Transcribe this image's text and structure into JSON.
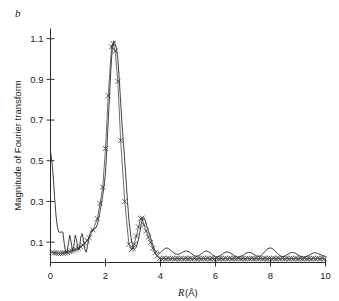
{
  "figure": {
    "panel_label": "b"
  },
  "chart_data": {
    "type": "line",
    "title": "",
    "subtitle": "",
    "panel": "b",
    "xlabel": "R (Å)",
    "xlabel_italic_part": "R",
    "xlabel_unit_part": " (Å)",
    "ylabel": "Magnitude of Fourier transform",
    "xlim": [
      0,
      10
    ],
    "ylim": [
      0,
      1.15
    ],
    "xticks": [
      0,
      2,
      4,
      6,
      8,
      10
    ],
    "xticklabels": [
      "0",
      "2",
      "4",
      "6",
      "8",
      "10"
    ],
    "yticks": [
      0.1,
      0.3,
      0.5,
      0.7,
      0.9,
      1.1
    ],
    "yticklabels": [
      "0.1",
      "0.3",
      "0.5",
      "0.7",
      "0.9",
      "1.1"
    ],
    "grid": false,
    "legend": null,
    "legend_position": "none",
    "series": [
      {
        "name": "experimental data",
        "style": "solid-line",
        "marker": "none",
        "color": "#2b2b2b",
        "x": [
          0.0,
          0.05,
          0.1,
          0.15,
          0.2,
          0.25,
          0.3,
          0.35,
          0.4,
          0.45,
          0.5,
          0.55,
          0.6,
          0.65,
          0.7,
          0.75,
          0.8,
          0.85,
          0.9,
          0.95,
          1.0,
          1.05,
          1.1,
          1.15,
          1.2,
          1.25,
          1.3,
          1.35,
          1.4,
          1.45,
          1.5,
          1.55,
          1.6,
          1.65,
          1.7,
          1.75,
          1.8,
          1.85,
          1.9,
          1.95,
          2.0,
          2.05,
          2.1,
          2.15,
          2.2,
          2.25,
          2.3,
          2.35,
          2.4,
          2.45,
          2.5,
          2.55,
          2.6,
          2.65,
          2.7,
          2.75,
          2.8,
          2.85,
          2.9,
          2.95,
          3.0,
          3.05,
          3.1,
          3.15,
          3.2,
          3.25,
          3.3,
          3.35,
          3.4,
          3.45,
          3.5,
          3.55,
          3.6,
          3.65,
          3.7,
          3.75,
          3.8,
          3.9,
          4.0,
          4.1,
          4.2,
          4.3,
          4.4,
          4.5,
          4.6,
          4.7,
          4.8,
          4.9,
          5.0,
          5.1,
          5.2,
          5.3,
          5.4,
          5.5,
          5.6,
          5.7,
          5.8,
          5.9,
          6.0,
          6.1,
          6.2,
          6.3,
          6.4,
          6.5,
          6.6,
          6.7,
          6.8,
          6.9,
          7.0,
          7.1,
          7.2,
          7.3,
          7.4,
          7.5,
          7.6,
          7.7,
          7.8,
          7.9,
          8.0,
          8.1,
          8.2,
          8.3,
          8.4,
          8.5,
          8.6,
          8.7,
          8.8,
          8.9,
          9.0,
          9.1,
          9.2,
          9.3,
          9.4,
          9.5,
          9.6,
          9.7,
          9.8,
          9.9,
          10.0
        ],
        "y": [
          0.545,
          0.5,
          0.42,
          0.32,
          0.23,
          0.175,
          0.15,
          0.148,
          0.15,
          0.15,
          0.092,
          0.05,
          0.052,
          0.092,
          0.135,
          0.1,
          0.06,
          0.08,
          0.135,
          0.11,
          0.062,
          0.065,
          0.125,
          0.142,
          0.108,
          0.065,
          0.05,
          0.085,
          0.125,
          0.148,
          0.16,
          0.16,
          0.165,
          0.17,
          0.185,
          0.215,
          0.25,
          0.29,
          0.33,
          0.38,
          0.44,
          0.56,
          0.7,
          0.83,
          0.96,
          1.06,
          1.09,
          1.075,
          1.05,
          1.0,
          0.9,
          0.79,
          0.68,
          0.59,
          0.5,
          0.4,
          0.3,
          0.21,
          0.15,
          0.105,
          0.075,
          0.065,
          0.072,
          0.09,
          0.115,
          0.15,
          0.19,
          0.215,
          0.22,
          0.205,
          0.18,
          0.16,
          0.14,
          0.118,
          0.095,
          0.075,
          0.058,
          0.046,
          0.048,
          0.062,
          0.072,
          0.068,
          0.057,
          0.046,
          0.04,
          0.042,
          0.05,
          0.057,
          0.055,
          0.046,
          0.036,
          0.03,
          0.034,
          0.045,
          0.055,
          0.056,
          0.048,
          0.036,
          0.028,
          0.028,
          0.036,
          0.046,
          0.052,
          0.05,
          0.042,
          0.032,
          0.026,
          0.028,
          0.036,
          0.045,
          0.05,
          0.048,
          0.04,
          0.032,
          0.03,
          0.04,
          0.055,
          0.068,
          0.072,
          0.066,
          0.052,
          0.038,
          0.029,
          0.03,
          0.038,
          0.046,
          0.05,
          0.046,
          0.038,
          0.03,
          0.026,
          0.029,
          0.036,
          0.044,
          0.048,
          0.046,
          0.04,
          0.034,
          0.03
        ]
      },
      {
        "name": "fit",
        "style": "cross-markers",
        "marker": "x",
        "color": "#2b2b2b",
        "x": [
          0.05,
          0.13,
          0.21,
          0.29,
          0.37,
          0.45,
          0.53,
          0.61,
          0.69,
          0.77,
          0.85,
          0.93,
          1.01,
          1.09,
          1.17,
          1.25,
          1.33,
          1.41,
          1.55,
          1.7,
          1.8,
          1.9,
          2.0,
          2.1,
          2.22,
          2.28,
          2.35,
          2.45,
          2.55,
          2.7,
          2.85,
          2.95,
          3.0,
          3.05,
          3.12,
          3.2,
          3.28,
          3.32,
          3.4,
          3.48,
          3.56,
          3.64,
          3.72,
          3.8,
          3.88,
          3.96,
          4.04,
          4.12,
          4.2,
          4.28,
          4.36,
          4.44,
          4.52,
          4.6,
          4.68,
          4.76,
          4.84,
          4.92,
          5.0,
          5.08,
          5.16,
          5.24,
          5.32,
          5.4,
          5.48,
          5.56,
          5.64,
          5.72,
          5.8,
          5.88,
          5.96,
          6.04,
          6.12,
          6.2,
          6.28,
          6.36,
          6.44,
          6.52,
          6.6,
          6.68,
          6.76,
          6.84,
          6.92,
          7.0,
          7.08,
          7.16,
          7.24,
          7.32,
          7.4,
          7.48,
          7.56,
          7.64,
          7.72,
          7.8,
          7.88,
          7.96,
          8.04,
          8.12,
          8.2,
          8.28,
          8.36,
          8.44,
          8.52,
          8.6,
          8.68,
          8.76,
          8.84,
          8.92,
          9.0,
          9.08,
          9.16,
          9.24,
          9.32,
          9.4,
          9.48,
          9.56,
          9.64,
          9.72,
          9.8,
          9.88,
          9.96
        ],
        "y": [
          0.05,
          0.047,
          0.046,
          0.045,
          0.045,
          0.046,
          0.048,
          0.05,
          0.053,
          0.056,
          0.06,
          0.064,
          0.07,
          0.077,
          0.085,
          0.095,
          0.108,
          0.122,
          0.16,
          0.215,
          0.29,
          0.37,
          0.56,
          0.82,
          1.06,
          1.075,
          1.04,
          0.89,
          0.6,
          0.3,
          0.09,
          0.065,
          0.07,
          0.09,
          0.13,
          0.175,
          0.215,
          0.218,
          0.185,
          0.155,
          0.125,
          0.098,
          0.07,
          0.048,
          0.032,
          0.02,
          0.018,
          0.02,
          0.018,
          0.02,
          0.018,
          0.02,
          0.018,
          0.02,
          0.018,
          0.02,
          0.018,
          0.02,
          0.018,
          0.02,
          0.018,
          0.02,
          0.018,
          0.02,
          0.018,
          0.02,
          0.018,
          0.02,
          0.018,
          0.02,
          0.018,
          0.02,
          0.018,
          0.02,
          0.018,
          0.02,
          0.018,
          0.02,
          0.018,
          0.02,
          0.018,
          0.02,
          0.018,
          0.02,
          0.018,
          0.02,
          0.018,
          0.02,
          0.018,
          0.02,
          0.018,
          0.02,
          0.018,
          0.02,
          0.018,
          0.02,
          0.018,
          0.02,
          0.018,
          0.02,
          0.018,
          0.02,
          0.018,
          0.02,
          0.018,
          0.02,
          0.018,
          0.02,
          0.018,
          0.02,
          0.018,
          0.02,
          0.018,
          0.02,
          0.018,
          0.02,
          0.018,
          0.02,
          0.018,
          0.02,
          0.018
        ]
      }
    ],
    "annotations": [
      {
        "text": "b",
        "position": "top-left"
      }
    ]
  }
}
